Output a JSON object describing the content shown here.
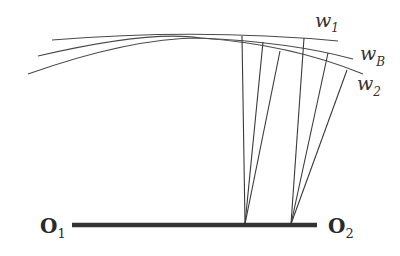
{
  "diagram": {
    "wavefronts": [
      {
        "id": "w1",
        "label": "w",
        "subscript": "1"
      },
      {
        "id": "wB",
        "label": "w",
        "subscript": "B"
      },
      {
        "id": "w2",
        "label": "w",
        "subscript": "2"
      }
    ],
    "points": [
      {
        "id": "O1",
        "label": "O",
        "subscript": "1"
      },
      {
        "id": "O2",
        "label": "O",
        "subscript": "2"
      }
    ],
    "ray_fans": [
      {
        "origin": "fan-1",
        "ray_count": 3
      },
      {
        "origin": "fan-2",
        "ray_count": 3
      }
    ],
    "colors": {
      "line": "#4a4a4a",
      "baseline": "#333333",
      "background": "#ffffff"
    }
  }
}
